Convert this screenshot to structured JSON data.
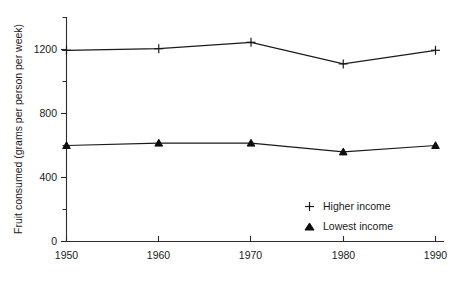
{
  "chart_data": {
    "type": "line",
    "title": "",
    "xlabel": "",
    "ylabel": "Fruit consumed (grams per person per week)",
    "x": [
      1950,
      1960,
      1970,
      1980,
      1990
    ],
    "categories": [
      "1950",
      "1960",
      "1970",
      "1980",
      "1990"
    ],
    "xtick_labels": [
      "1950",
      "1960",
      "1970",
      "1980",
      "1990"
    ],
    "ytick_labels": [
      "0",
      "400",
      "800",
      "1200"
    ],
    "ytick_values": [
      0,
      400,
      800,
      1200
    ],
    "yminor_values": [
      200,
      600,
      1000,
      1400
    ],
    "xlim": [
      1950,
      1990
    ],
    "ylim": [
      0,
      1400
    ],
    "grid": false,
    "legend_position": "inside-lower-right",
    "series": [
      {
        "name": "Higher income",
        "marker": "plus",
        "values": [
          1195,
          1205,
          1245,
          1110,
          1195
        ]
      },
      {
        "name": "Lowest income",
        "marker": "triangle",
        "values": [
          600,
          615,
          615,
          560,
          600
        ]
      }
    ]
  },
  "legend": {
    "items": [
      {
        "label": "Higher income",
        "marker": "plus-marker"
      },
      {
        "label": "Lowest income",
        "marker": "triangle-marker"
      }
    ]
  },
  "colors": {
    "ink": "#1a1a1a",
    "axis": "#2b2b2b",
    "background": "#ffffff"
  }
}
